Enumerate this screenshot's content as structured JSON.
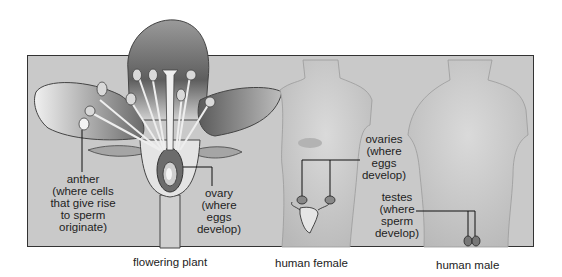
{
  "diagram": {
    "panels": [
      {
        "caption": "flowering plant",
        "labels": [
          {
            "id": "anther",
            "lines": [
              "anther",
              "(where cells",
              "that give rise",
              "to sperm",
              "originate)"
            ]
          },
          {
            "id": "ovary",
            "lines": [
              "ovary",
              "(where",
              "eggs",
              "develop)"
            ]
          }
        ]
      },
      {
        "caption": "human female",
        "labels": [
          {
            "id": "ovaries",
            "lines": [
              "ovaries",
              "(where",
              "eggs",
              "develop)"
            ]
          }
        ]
      },
      {
        "caption": "human male",
        "labels": [
          {
            "id": "testes",
            "lines": [
              "testes",
              "(where",
              "sperm",
              "develop)"
            ]
          }
        ]
      }
    ]
  },
  "colors": {
    "panel_background": "#c9c9c9",
    "border": "#333333",
    "silhouette": "#d6d6d6",
    "petal_dark": "#7a7a7a",
    "petal_light": "#e8e8e8"
  }
}
